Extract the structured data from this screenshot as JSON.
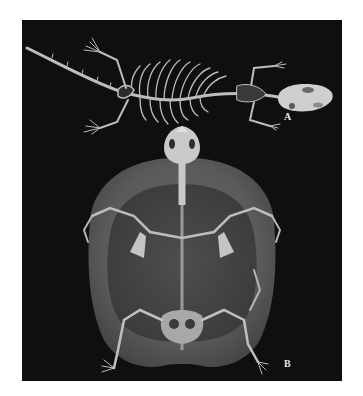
{
  "figure": {
    "background_color": "#0f0f0f",
    "panels": [
      {
        "label": "A",
        "subject": "lizard skeleton, dorsal view"
      },
      {
        "label": "B",
        "subject": "turtle skeleton within shell, ventral view"
      }
    ]
  }
}
